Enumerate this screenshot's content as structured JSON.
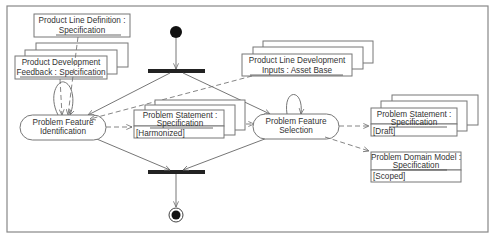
{
  "diagram": {
    "type": "UML activity diagram",
    "activities": [
      {
        "id": "identification",
        "line1": "Problem Feature",
        "line2": "Identification"
      },
      {
        "id": "selection",
        "line1": "Problem Feature",
        "line2": "Selection"
      }
    ],
    "objects": [
      {
        "id": "pld_spec",
        "line1": "Product Line Definition :",
        "line2": "Specification",
        "state": ""
      },
      {
        "id": "pd_feedback",
        "line1": "Product Development",
        "line2": "Feedback : Specification",
        "state": ""
      },
      {
        "id": "pld_inputs",
        "line1": "Product Line Development",
        "line2": "Inputs : Asset Base",
        "state": ""
      },
      {
        "id": "ps_harmonized",
        "line1": "Problem Statement :",
        "line2": "Specification",
        "state": "[Harmonized]"
      },
      {
        "id": "ps_draft",
        "line1": "Problem Statement :",
        "line2": "Specification",
        "state": "[Draft]"
      },
      {
        "id": "pdm_scoped",
        "line1": "Problem Domain Model :",
        "line2": "Specification",
        "state": "[Scoped]"
      }
    ],
    "nodes": [
      "initial-node",
      "fork-bar",
      "join-bar",
      "final-node"
    ]
  }
}
